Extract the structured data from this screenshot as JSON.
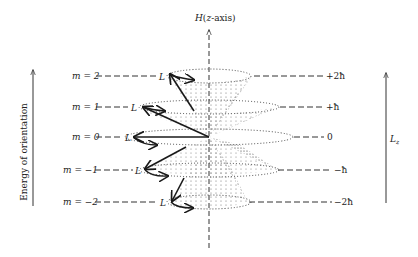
{
  "diagram": {
    "axis_label": "H(z-axis)",
    "left_arrow_label": "Energy of orientation",
    "right_arrow_label": "L_z",
    "right_arrow_label_main": "L",
    "right_arrow_label_sub": "z",
    "vector_label": "L",
    "levels": [
      {
        "m_label": "m = 2",
        "m": 2,
        "lz_label": "+2ħ",
        "y": 76
      },
      {
        "m_label": "m = 1",
        "m": 1,
        "lz_label": "+ħ",
        "y": 107
      },
      {
        "m_label": "m = 0",
        "m": 0,
        "lz_label": "0",
        "y": 137
      },
      {
        "m_label": "m = −1",
        "m": -1,
        "lz_label": "−ħ",
        "y": 170
      },
      {
        "m_label": "m = −2",
        "m": -2,
        "lz_label": "−2ħ",
        "y": 202
      }
    ],
    "colors": {
      "ink": "#1a1a1a",
      "dots": "#333333",
      "background": "#ffffff"
    }
  }
}
